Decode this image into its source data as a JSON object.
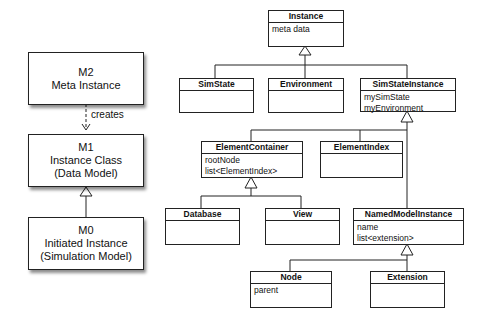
{
  "meta_levels": [
    {
      "id": "m2",
      "lines": [
        "M2",
        "Meta Instance"
      ]
    },
    {
      "id": "m1",
      "lines": [
        "M1",
        "Instance Class",
        "(Data Model)"
      ]
    },
    {
      "id": "m0",
      "lines": [
        "M0",
        "Initiated Instance",
        "(Simulation Model)"
      ]
    }
  ],
  "relations": {
    "creates_label": "creates"
  },
  "classes": {
    "instance": {
      "name": "Instance",
      "attrs": [
        "meta data"
      ]
    },
    "simstate": {
      "name": "SimState",
      "attrs": []
    },
    "environment": {
      "name": "Environment",
      "attrs": []
    },
    "simstateinstance": {
      "name": "SimStateInstance",
      "attrs": [
        "mySimState",
        "myEnvironment"
      ]
    },
    "elementcontainer": {
      "name": "ElementContainer",
      "attrs": [
        "rootNode",
        "list<ElementIndex>"
      ]
    },
    "elementindex": {
      "name": "ElementIndex",
      "attrs": []
    },
    "database": {
      "name": "Database",
      "attrs": []
    },
    "view": {
      "name": "View",
      "attrs": []
    },
    "namedmodelinstance": {
      "name": "NamedModelInstance",
      "attrs": [
        "name",
        "list<extension>"
      ]
    },
    "node": {
      "name": "Node",
      "attrs": [
        "parent"
      ]
    },
    "extension": {
      "name": "Extension",
      "attrs": []
    }
  }
}
